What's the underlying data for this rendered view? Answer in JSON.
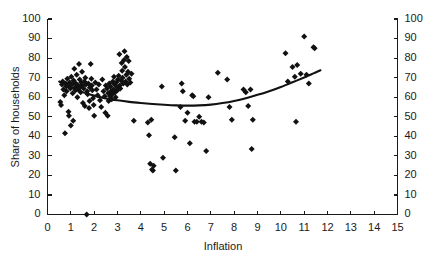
{
  "chart_data": {
    "type": "scatter",
    "title": "",
    "xlabel": "Inflation",
    "ylabel": "Share of households",
    "xlim": [
      0,
      15
    ],
    "ylim": [
      0,
      100
    ],
    "xticks": [
      0,
      1,
      2,
      3,
      4,
      5,
      6,
      7,
      8,
      9,
      10,
      11,
      12,
      13,
      14,
      15
    ],
    "yticks": [
      0,
      10,
      20,
      30,
      40,
      50,
      60,
      70,
      80,
      90,
      100
    ],
    "xtick_labels": [
      "0",
      "1",
      "2",
      "3",
      "4",
      "5",
      "6",
      "7",
      "8",
      "9",
      "10",
      "11",
      "12",
      "13",
      "14",
      "15"
    ],
    "ytick_labels": [
      "0",
      "10",
      "20",
      "30",
      "40",
      "50",
      "60",
      "70",
      "80",
      "90",
      "100"
    ],
    "grid": false,
    "legend": null,
    "legend_position": "none",
    "dual_y_axis": true,
    "right_ytick_labels": [
      "0",
      "10",
      "20",
      "30",
      "40",
      "50",
      "60",
      "70",
      "80",
      "90",
      "100"
    ],
    "marker": "diamond",
    "marker_color": "#111111",
    "marker_size": 3.0,
    "series": [
      {
        "name": "Share of households vs Inflation",
        "points": [
          [
            0.55,
            57.5
          ],
          [
            0.58,
            56.0
          ],
          [
            0.62,
            66.5
          ],
          [
            0.65,
            68.0
          ],
          [
            0.68,
            64.0
          ],
          [
            0.72,
            61.0
          ],
          [
            0.75,
            41.5
          ],
          [
            0.78,
            67.0
          ],
          [
            0.8,
            65.5
          ],
          [
            0.82,
            63.0
          ],
          [
            0.85,
            69.5
          ],
          [
            0.88,
            66.0
          ],
          [
            0.9,
            52.5
          ],
          [
            0.92,
            50.5
          ],
          [
            0.95,
            67.5
          ],
          [
            0.98,
            64.5
          ],
          [
            1.0,
            45.5
          ],
          [
            1.02,
            70.5
          ],
          [
            1.05,
            66.5
          ],
          [
            1.08,
            62.0
          ],
          [
            1.1,
            48.0
          ],
          [
            1.12,
            68.5
          ],
          [
            1.15,
            74.5
          ],
          [
            1.18,
            65.0
          ],
          [
            1.2,
            63.5
          ],
          [
            1.22,
            67.0
          ],
          [
            1.25,
            71.5
          ],
          [
            1.28,
            60.0
          ],
          [
            1.3,
            66.0
          ],
          [
            1.32,
            64.0
          ],
          [
            1.35,
            77.0
          ],
          [
            1.38,
            69.0
          ],
          [
            1.4,
            65.5
          ],
          [
            1.42,
            62.5
          ],
          [
            1.45,
            67.5
          ],
          [
            1.48,
            73.0
          ],
          [
            1.5,
            66.0
          ],
          [
            1.52,
            57.0
          ],
          [
            1.55,
            64.5
          ],
          [
            1.58,
            68.0
          ],
          [
            1.6,
            55.5
          ],
          [
            1.62,
            70.0
          ],
          [
            1.65,
            66.5
          ],
          [
            1.68,
            0.0
          ],
          [
            1.7,
            63.0
          ],
          [
            1.72,
            61.5
          ],
          [
            1.75,
            67.0
          ],
          [
            1.78,
            54.5
          ],
          [
            1.8,
            58.0
          ],
          [
            1.82,
            65.0
          ],
          [
            1.85,
            77.0
          ],
          [
            1.88,
            69.5
          ],
          [
            1.9,
            66.0
          ],
          [
            1.92,
            63.5
          ],
          [
            1.95,
            59.5
          ],
          [
            1.98,
            56.0
          ],
          [
            2.0,
            50.5
          ],
          [
            2.05,
            67.5
          ],
          [
            2.1,
            64.0
          ],
          [
            2.15,
            61.0
          ],
          [
            2.2,
            66.5
          ],
          [
            2.25,
            58.5
          ],
          [
            2.3,
            55.0
          ],
          [
            2.35,
            69.0
          ],
          [
            2.4,
            63.0
          ],
          [
            2.45,
            60.5
          ],
          [
            2.48,
            52.0
          ],
          [
            2.5,
            66.0
          ],
          [
            2.55,
            64.5
          ],
          [
            2.58,
            50.5
          ],
          [
            2.6,
            62.0
          ],
          [
            2.62,
            58.0
          ],
          [
            2.65,
            67.0
          ],
          [
            2.68,
            60.5
          ],
          [
            2.7,
            65.5
          ],
          [
            2.72,
            63.0
          ],
          [
            2.75,
            59.0
          ],
          [
            2.78,
            61.5
          ],
          [
            2.8,
            68.0
          ],
          [
            2.82,
            64.0
          ],
          [
            2.85,
            70.5
          ],
          [
            2.88,
            66.5
          ],
          [
            2.9,
            62.5
          ],
          [
            2.92,
            60.0
          ],
          [
            2.95,
            67.5
          ],
          [
            2.98,
            65.0
          ],
          [
            3.0,
            63.5
          ],
          [
            3.02,
            69.0
          ],
          [
            3.05,
            71.0
          ],
          [
            3.08,
            82.0
          ],
          [
            3.1,
            66.0
          ],
          [
            3.12,
            64.5
          ],
          [
            3.15,
            68.5
          ],
          [
            3.18,
            77.5
          ],
          [
            3.2,
            73.5
          ],
          [
            3.22,
            70.0
          ],
          [
            3.25,
            67.0
          ],
          [
            3.28,
            79.0
          ],
          [
            3.3,
            83.5
          ],
          [
            3.32,
            75.5
          ],
          [
            3.35,
            68.0
          ],
          [
            3.38,
            71.5
          ],
          [
            3.4,
            80.5
          ],
          [
            3.42,
            66.5
          ],
          [
            3.45,
            73.0
          ],
          [
            3.48,
            78.5
          ],
          [
            3.5,
            69.5
          ],
          [
            3.55,
            67.5
          ],
          [
            3.6,
            72.0
          ],
          [
            3.7,
            48.0
          ],
          [
            4.3,
            47.0
          ],
          [
            4.35,
            40.5
          ],
          [
            4.4,
            26.0
          ],
          [
            4.45,
            48.5
          ],
          [
            4.48,
            23.0
          ],
          [
            4.52,
            22.5
          ],
          [
            4.55,
            25.0
          ],
          [
            4.9,
            65.5
          ],
          [
            4.95,
            29.0
          ],
          [
            5.45,
            39.5
          ],
          [
            5.5,
            22.5
          ],
          [
            5.7,
            55.0
          ],
          [
            5.75,
            67.0
          ],
          [
            5.8,
            63.0
          ],
          [
            5.9,
            48.0
          ],
          [
            6.0,
            52.0
          ],
          [
            6.1,
            36.5
          ],
          [
            6.2,
            61.0
          ],
          [
            6.25,
            60.5
          ],
          [
            6.3,
            47.5
          ],
          [
            6.4,
            47.5
          ],
          [
            6.5,
            50.0
          ],
          [
            6.6,
            47.5
          ],
          [
            6.7,
            47.0
          ],
          [
            6.8,
            32.5
          ],
          [
            6.9,
            60.0
          ],
          [
            7.3,
            72.5
          ],
          [
            7.7,
            69.0
          ],
          [
            7.8,
            55.0
          ],
          [
            7.9,
            48.5
          ],
          [
            8.4,
            64.0
          ],
          [
            8.5,
            62.5
          ],
          [
            8.6,
            55.5
          ],
          [
            8.7,
            64.0
          ],
          [
            8.75,
            33.5
          ],
          [
            8.8,
            48.5
          ],
          [
            10.2,
            82.5
          ],
          [
            10.3,
            68.0
          ],
          [
            10.5,
            75.5
          ],
          [
            10.6,
            70.5
          ],
          [
            10.65,
            47.5
          ],
          [
            10.7,
            76.5
          ],
          [
            10.85,
            72.0
          ],
          [
            11.0,
            91.0
          ],
          [
            11.1,
            71.5
          ],
          [
            11.2,
            67.0
          ],
          [
            11.4,
            85.5
          ],
          [
            11.45,
            85.0
          ]
        ]
      }
    ],
    "trend_line": {
      "name": "quadratic fit",
      "color": "#111111",
      "points": [
        [
          0.5,
          68.0
        ],
        [
          1.0,
          65.0
        ],
        [
          1.5,
          62.6
        ],
        [
          2.0,
          60.8
        ],
        [
          2.5,
          59.4
        ],
        [
          3.0,
          58.4
        ],
        [
          3.5,
          57.6
        ],
        [
          4.0,
          57.0
        ],
        [
          4.5,
          56.5
        ],
        [
          5.0,
          56.1
        ],
        [
          5.5,
          55.8
        ],
        [
          6.0,
          55.7
        ],
        [
          6.5,
          55.8
        ],
        [
          7.0,
          56.2
        ],
        [
          7.5,
          57.0
        ],
        [
          8.0,
          58.1
        ],
        [
          8.5,
          59.5
        ],
        [
          9.0,
          61.2
        ],
        [
          9.5,
          63.1
        ],
        [
          10.0,
          65.2
        ],
        [
          10.5,
          67.6
        ],
        [
          11.0,
          70.1
        ],
        [
          11.4,
          72.2
        ],
        [
          11.7,
          73.8
        ]
      ]
    }
  },
  "axes": {
    "left_axis_name": "left-y-axis",
    "right_axis_name": "right-y-axis",
    "bottom_axis_name": "x-axis"
  }
}
